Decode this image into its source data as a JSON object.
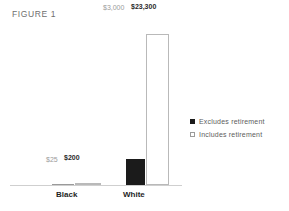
{
  "figure": {
    "title": "FIGURE 1"
  },
  "legend": {
    "items": [
      {
        "label": "Excludes retirement",
        "marker": "filled-square",
        "color": "#1b1b1b"
      },
      {
        "label": "Includes retirement",
        "marker": "open-square",
        "color": "#ffffff"
      }
    ]
  },
  "categories": {
    "black": "Black",
    "white": "White"
  },
  "labels": {
    "black_excludes": "$25",
    "black_includes": "$200",
    "white_excludes": "$3,000",
    "white_includes": "$23,300"
  },
  "chart_data": {
    "type": "bar",
    "title": "FIGURE 1",
    "categories": [
      "Black",
      "White"
    ],
    "series": [
      {
        "name": "Excludes retirement",
        "values": [
          25,
          3000
        ],
        "color": "#1b1b1b",
        "style": "filled"
      },
      {
        "name": "Includes retirement",
        "values": [
          200,
          23300
        ],
        "color": "#ffffff",
        "style": "outlined"
      }
    ],
    "value_labels": [
      [
        "$25",
        "$3,000"
      ],
      [
        "$200",
        "$23,300"
      ]
    ],
    "xlabel": "",
    "ylabel": "",
    "ylim": [
      0,
      26000
    ],
    "grid": false,
    "legend_position": "right"
  }
}
